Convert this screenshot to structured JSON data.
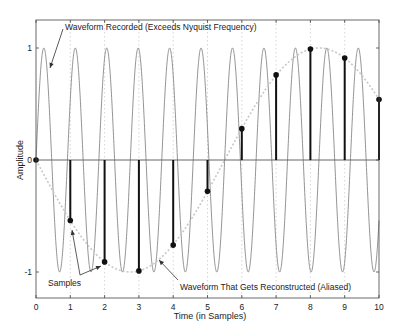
{
  "chart_data": {
    "type": "line",
    "title": "",
    "xlabel": "Time (in Samples)",
    "ylabel": "Amplitude",
    "xlim": [
      0,
      10
    ],
    "ylim": [
      -1.2,
      1.3
    ],
    "xticks": [
      0,
      1,
      2,
      3,
      4,
      5,
      6,
      7,
      8,
      9,
      10
    ],
    "yticks": [
      -1,
      0,
      1
    ],
    "ytick_labels": [
      "-1",
      "0",
      "1"
    ],
    "grid": "vertical dotted at integer x",
    "series": [
      {
        "name": "Waveform Recorded (Exceeds Nyquist Frequency)",
        "style": "thin gray solid",
        "function": "sin(2*pi*1.0909*t)",
        "frequency_cycles_per_sample": 1.0909
      },
      {
        "name": "Waveform That Gets Reconstructed (Aliased)",
        "style": "light gray dotted",
        "function": "sin(-2*pi*0.0909*t)",
        "frequency_cycles_per_sample": -0.0909
      },
      {
        "name": "Samples",
        "style": "black stems with dots",
        "x": [
          0,
          1,
          2,
          3,
          4,
          5,
          6,
          7,
          8,
          9,
          10
        ],
        "values": [
          0,
          -0.54,
          -0.91,
          -0.99,
          -0.76,
          -0.28,
          0.28,
          0.76,
          0.99,
          0.91,
          0.54
        ]
      }
    ],
    "annotations": [
      {
        "text": "Waveform Recorded (Exceeds Nyquist Frequency)",
        "x": 0.52,
        "y": 1.17,
        "arrow_to": [
          0.3,
          0.8
        ]
      },
      {
        "text": "Samples",
        "x": 0.3,
        "y": -1.14,
        "arrows_to": [
          [
            1.03,
            -0.63
          ],
          [
            1.88,
            -0.92
          ]
        ]
      },
      {
        "text": "Waveform That Gets Reconstructed (Aliased)",
        "x": 4.2,
        "y": -1.14,
        "arrow_to": [
          3.6,
          -0.95
        ]
      }
    ]
  },
  "labels": {
    "xlabel": "Time (in Samples)",
    "ylabel": "Amplitude",
    "annotation_recorded": "Waveform Recorded (Exceeds Nyquist Frequency)",
    "annotation_samples": "Samples",
    "annotation_aliased": "Waveform That Gets Reconstructed (Aliased)"
  }
}
